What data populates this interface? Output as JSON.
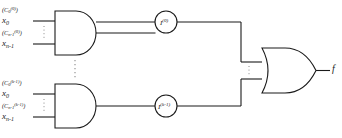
{
  "figure": {
    "type": "logic-circuit-diagram",
    "ink_color": "#1a1a1a",
    "background": "#ffffff"
  },
  "inputs": {
    "top_gate": [
      {
        "id": "x0-0",
        "base": "x",
        "subscript": "0",
        "superscript_full": "(C_0^(0))",
        "sup_base": "(C",
        "sup_sub": "0",
        "sup_sup": "(0)",
        "sup_close": ")"
      },
      {
        "id": "xn1-0",
        "base": "x",
        "subscript": "n-1",
        "superscript_full": "(C_n-1^(0))",
        "sup_base": "(C",
        "sup_sub": "n-1",
        "sup_sup": "(0)",
        "sup_close": ")"
      }
    ],
    "bottom_gate": [
      {
        "id": "x0-k1",
        "base": "x",
        "subscript": "0",
        "superscript_full": "(C_0^(k-1))",
        "sup_base": "(C",
        "sup_sub": "0",
        "sup_sup": "(k-1)",
        "sup_close": ")"
      },
      {
        "id": "xn1-k1",
        "base": "x",
        "subscript": "n-1",
        "superscript_full": "(C_n-1^(k-1))",
        "sup_base": "(C",
        "sup_sub": "n-1",
        "sup_sup": "(k-1)",
        "sup_close": ")"
      }
    ]
  },
  "gates": {
    "and_top": {
      "type": "AND",
      "label": "AND gate 0"
    },
    "and_bottom": {
      "type": "AND",
      "label": "AND gate k-1"
    },
    "or_gate": {
      "type": "OR",
      "label": "OR gate"
    }
  },
  "nodes": {
    "top": {
      "base": "I",
      "superscript": "(0)"
    },
    "bottom": {
      "base": "I",
      "superscript": "(k-1)"
    }
  },
  "output": {
    "label": "f"
  },
  "ellipses": {
    "input_top": "vertical dots between top gate inputs",
    "input_bottom": "vertical dots between bottom gate inputs",
    "between_gates": "vertical dots between AND gates",
    "or_inputs": "vertical dots between OR gate inputs"
  }
}
